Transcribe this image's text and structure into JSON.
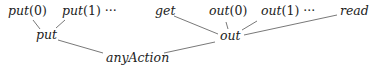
{
  "diagram": {
    "type": "tree",
    "nodes": {
      "put0": {
        "label": "put",
        "arg": "(0)",
        "suffix": ""
      },
      "put1": {
        "label": "put",
        "arg": "(1)",
        "suffix": " ···"
      },
      "put": {
        "label": "put"
      },
      "anyAction": {
        "label": "anyAction"
      },
      "get": {
        "label": "get"
      },
      "out0": {
        "label": "out",
        "arg": "(0)",
        "suffix": ""
      },
      "out1": {
        "label": "out",
        "arg": "(1)",
        "suffix": " ···"
      },
      "read": {
        "label": "read"
      },
      "out": {
        "label": "out"
      }
    },
    "edges": [
      {
        "from": "put0",
        "to": "put"
      },
      {
        "from": "put1",
        "to": "put"
      },
      {
        "from": "put",
        "to": "anyAction"
      },
      {
        "from": "out",
        "to": "anyAction"
      },
      {
        "from": "get",
        "to": "out"
      },
      {
        "from": "out0",
        "to": "out"
      },
      {
        "from": "out1",
        "to": "out"
      },
      {
        "from": "read",
        "to": "out"
      }
    ],
    "colors": {
      "text": "#222222",
      "edge": "#555555"
    }
  }
}
